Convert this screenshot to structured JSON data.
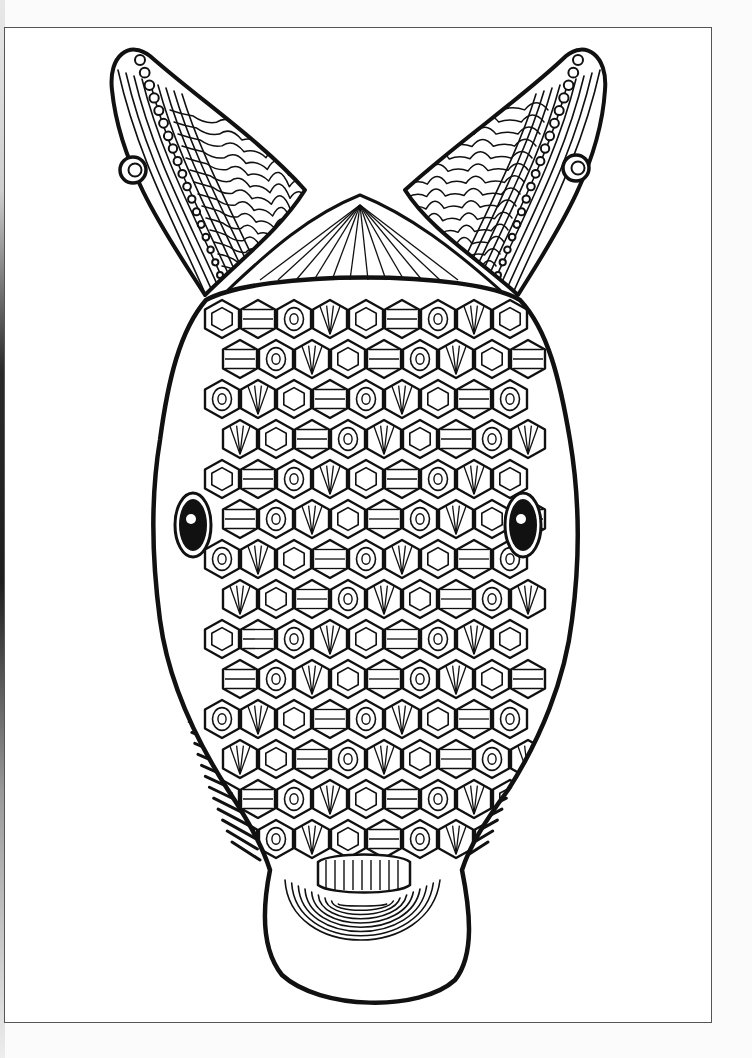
{
  "page": {
    "ink_color": "#111111",
    "paper_color": "#ffffff",
    "background_color": "#fbfbfb",
    "frame_color": "#555555"
  },
  "illustration": {
    "outline": {
      "head": "M206,300 C180,330 168,380 160,440 C150,500 152,560 160,620 C168,680 196,740 228,790 C248,820 262,845 270,870 C262,910 262,950 282,975 C320,1010 420,1012 455,980 C475,955 470,910 462,870 C470,845 486,820 508,790 C540,740 565,680 572,620 C580,560 580,500 570,440 C560,380 548,330 520,300 C470,270 260,270 206,300 Z",
      "left_ear": "M205,295 C170,240 120,170 112,90 C108,55 130,40 150,56 C200,100 260,140 305,190 C280,230 240,260 205,295 Z",
      "right_ear": "M518,295 C552,240 600,170 605,90 C608,55 585,40 566,56 C520,100 460,140 405,190 C430,230 480,260 518,295 Z",
      "crest": "M228,290 C270,250 310,215 360,195 C410,215 455,250 500,290",
      "left_earring": {
        "cx": 133,
        "cy": 170,
        "r": 13
      },
      "right_earring": {
        "cx": 576,
        "cy": 168,
        "r": 13
      },
      "left_eye": {
        "cx": 193,
        "cy": 525,
        "rx": 14,
        "ry": 26
      },
      "right_eye": {
        "cx": 523,
        "cy": 525,
        "rx": 14,
        "ry": 26
      },
      "snout_rings": 9
    },
    "scale_grid": {
      "rows": 14,
      "cols": 9,
      "x0": 205,
      "y0": 300,
      "cell_w": 36,
      "cell_h": 40
    },
    "whiskers": {
      "left": {
        "x": 220,
        "y_start": 630,
        "y_end": 860,
        "count": 22,
        "dir": -1
      },
      "right": {
        "x": 508,
        "y_start": 630,
        "y_end": 860,
        "count": 22,
        "dir": 1
      }
    }
  }
}
